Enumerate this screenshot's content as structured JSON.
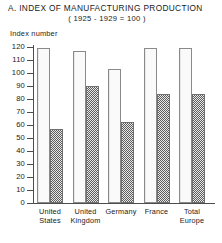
{
  "chart_data": {
    "type": "bar",
    "title": "A. INDEX OF MANUFACTURING PRODUCTION",
    "subtitle": "( 1925 - 1929 = 100 )",
    "ylabel": "Index number",
    "xlabel": "",
    "ylim": [
      0,
      120
    ],
    "yticks": [
      120,
      110,
      100,
      90,
      80,
      70,
      60,
      50,
      40,
      30,
      20,
      10,
      0
    ],
    "ytick_labels": [
      "120",
      "110",
      "100",
      "90",
      "80",
      "70",
      "60",
      "50",
      "40",
      "30",
      "20",
      "10",
      "0"
    ],
    "grid": false,
    "legend": "none",
    "categories": [
      "United States",
      "United Kingdom",
      "Germany",
      "France",
      "Total Europe"
    ],
    "category_lines": [
      [
        "United",
        "States"
      ],
      [
        "United",
        "Kingdom"
      ],
      [
        "Germany"
      ],
      [
        "France"
      ],
      [
        "Total",
        "Europe"
      ]
    ],
    "series": [
      {
        "name": "light",
        "style": "plain-white",
        "values": [
          119,
          117,
          103,
          119,
          119
        ]
      },
      {
        "name": "dark",
        "style": "checkered-gray",
        "values": [
          57,
          90,
          62,
          84,
          84
        ]
      }
    ],
    "colors": {
      "light_fill": "#fafafa",
      "light_edge": "#8a8a8a",
      "dark_fill": "#5e5e5e",
      "dark_edge": "#6f6f6f",
      "axis": "#4d4d4d",
      "text": "#1a1a1a",
      "background": "#ffffff"
    }
  }
}
